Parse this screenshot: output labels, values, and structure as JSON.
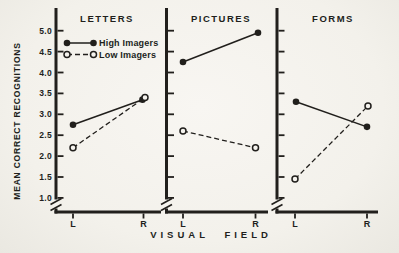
{
  "figure": {
    "y_axis_label": "MEAN CORRECT RECOGNITIONS",
    "x_axis_label": "VISUAL FIELD",
    "y_ticks": [
      "5.0",
      "4.5",
      "4.0",
      "3.5",
      "3.0",
      "2.5",
      "2.0",
      "1.5",
      "1.0"
    ],
    "y_tick_values": [
      5.0,
      4.5,
      4.0,
      3.5,
      3.0,
      2.5,
      2.0,
      1.5,
      1.0
    ],
    "axis_break": true,
    "legend": [
      {
        "label": "High Imagers",
        "marker": "filled-circle",
        "line_style": "solid"
      },
      {
        "label": "Low Imagers",
        "marker": "open-circle",
        "line_style": "dashed"
      }
    ],
    "colors": {
      "ink": "#211f1c",
      "paper": "#f5f3ee"
    }
  },
  "chart_data": [
    {
      "type": "line",
      "title": "LETTERS",
      "categories": [
        "L",
        "R"
      ],
      "xlabel": "VISUAL FIELD",
      "ylabel": "MEAN CORRECT RECOGNITIONS",
      "ylim": [
        1.0,
        5.0
      ],
      "series": [
        {
          "name": "High Imagers",
          "values": [
            2.75,
            3.35
          ]
        },
        {
          "name": "Low Imagers",
          "values": [
            2.2,
            3.4
          ]
        }
      ]
    },
    {
      "type": "line",
      "title": "PICTURES",
      "categories": [
        "L",
        "R"
      ],
      "xlabel": "VISUAL FIELD",
      "ylabel": "MEAN CORRECT RECOGNITIONS",
      "ylim": [
        1.0,
        5.0
      ],
      "series": [
        {
          "name": "High Imagers",
          "values": [
            4.25,
            4.95
          ]
        },
        {
          "name": "Low Imagers",
          "values": [
            2.6,
            2.2
          ]
        }
      ]
    },
    {
      "type": "line",
      "title": "FORMS",
      "categories": [
        "L",
        "R"
      ],
      "xlabel": "VISUAL FIELD",
      "ylabel": "MEAN CORRECT RECOGNITIONS",
      "ylim": [
        1.0,
        5.0
      ],
      "series": [
        {
          "name": "High Imagers",
          "values": [
            3.3,
            2.7
          ]
        },
        {
          "name": "Low Imagers",
          "values": [
            1.45,
            3.2
          ]
        }
      ]
    }
  ]
}
